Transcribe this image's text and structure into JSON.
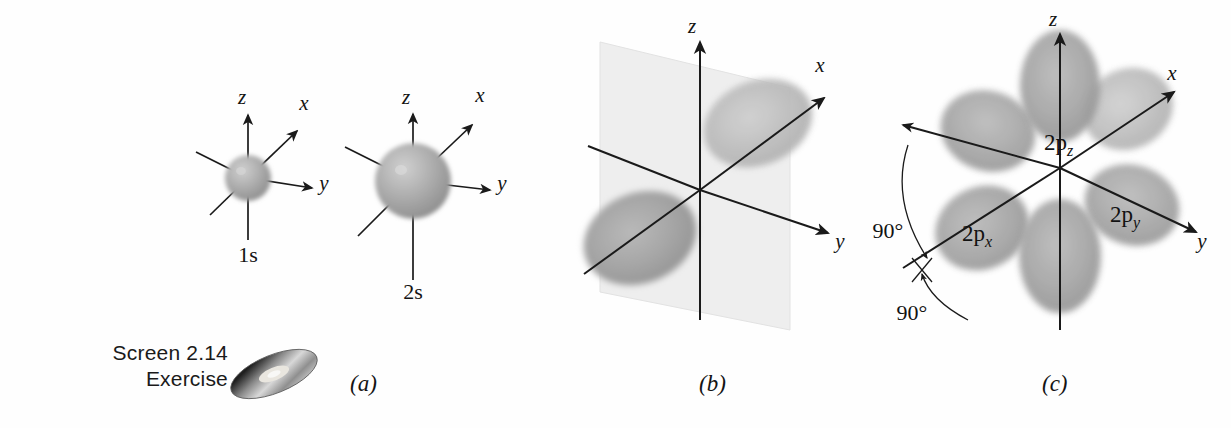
{
  "figure": {
    "background_color": "#fefefe",
    "orbital_fill": "#9c9c9c",
    "orbital_fill_light": "#b6b6b6",
    "axis_color": "#1a1a1a",
    "nodal_plane_color": "#ececec"
  },
  "media_note": {
    "line1": "Screen 2.14",
    "line2": "Exercise",
    "icon": "compact-disc-icon"
  },
  "panels": [
    {
      "id": "a",
      "label": "(a)",
      "caption_x": 350,
      "caption_y": 371,
      "orbitals": [
        {
          "name": "1s",
          "label": "1s",
          "type": "sphere",
          "center": [
            248,
            178
          ],
          "radius": 23,
          "axes": [
            {
              "name": "z",
              "label": "z",
              "label_pos": [
                242,
                98
              ]
            },
            {
              "name": "x",
              "label": "x",
              "label_pos": [
                304,
                104
              ]
            },
            {
              "name": "y",
              "label": "y",
              "label_pos": [
                322,
                182
              ]
            }
          ],
          "label_pos": [
            248,
            258
          ]
        },
        {
          "name": "2s",
          "label": "2s",
          "type": "sphere",
          "center": [
            413,
            181
          ],
          "radius": 38,
          "axes": [
            {
              "name": "z",
              "label": "z",
              "label_pos": [
                406,
                98
              ]
            },
            {
              "name": "x",
              "label": "x",
              "label_pos": [
                478,
                96
              ]
            },
            {
              "name": "y",
              "label": "y",
              "label_pos": [
                500,
                182
              ]
            }
          ],
          "label_pos": [
            413,
            295
          ]
        }
      ]
    },
    {
      "id": "b",
      "label": "(b)",
      "caption_x": 699,
      "caption_y": 371,
      "description": "Single 2p orbital with two lobes and a nodal plane",
      "origin": [
        700,
        190
      ],
      "nodal_plane": true,
      "axes": [
        {
          "name": "z",
          "label": "z",
          "label_pos": [
            692,
            26
          ]
        },
        {
          "name": "x",
          "label": "x",
          "label_pos": [
            818,
            64
          ]
        },
        {
          "name": "y",
          "label": "y",
          "label_pos": [
            838,
            240
          ]
        }
      ]
    },
    {
      "id": "c",
      "label": "(c)",
      "caption_x": 1042,
      "caption_y": 371,
      "description": "All three 2p orbitals shown together, mutually perpendicular",
      "origin": [
        1060,
        168
      ],
      "axes": [
        {
          "name": "z",
          "label": "z",
          "label_pos": [
            1053,
            18
          ]
        },
        {
          "name": "x",
          "label": "x",
          "label_pos": [
            1170,
            72
          ]
        },
        {
          "name": "y",
          "label": "y",
          "label_pos": [
            1196,
            240
          ]
        }
      ],
      "orbital_labels": [
        {
          "name": "2p_z",
          "base": "2p",
          "sub": "z",
          "pos": [
            1044,
            142
          ]
        },
        {
          "name": "2p_x",
          "base": "2p",
          "sub": "x",
          "pos": [
            962,
            233
          ]
        },
        {
          "name": "2p_y",
          "base": "2p",
          "sub": "y",
          "pos": [
            1110,
            214
          ]
        }
      ],
      "angle_annotations": [
        {
          "name": "angle-upper",
          "value": "90°",
          "pos": [
            888,
            230
          ]
        },
        {
          "name": "angle-lower",
          "value": "90°",
          "pos": [
            910,
            312
          ]
        }
      ]
    }
  ]
}
